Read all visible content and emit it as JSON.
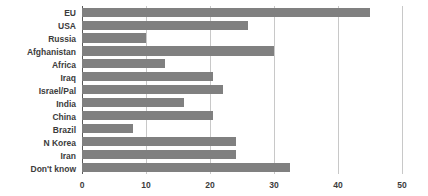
{
  "chart_data": {
    "type": "bar",
    "orientation": "horizontal",
    "title": "",
    "subtitle": "",
    "xlabel": "",
    "ylabel": "",
    "xlim": [
      0,
      50
    ],
    "ylim": null,
    "xticks": [
      0,
      10,
      20,
      30,
      40,
      50
    ],
    "xtick_labels": [
      "0",
      "10",
      "20",
      "30",
      "40",
      "50"
    ],
    "grid": "vertical",
    "legend": null,
    "legend_position": "none",
    "bar_color": "#808080",
    "gridline_color": "#c8c8c8",
    "axis_color": "#5a5a5a",
    "background_color": "#ffffff",
    "label_color": "#3c3c3c",
    "categories": [
      "EU",
      "USA",
      "Russia",
      "Afghanistan",
      "Africa",
      "Iraq",
      "Israel/Pal",
      "India",
      "China",
      "Brazil",
      "N Korea",
      "Iran",
      "Don't know"
    ],
    "values": [
      45,
      26,
      10,
      30,
      13,
      20.5,
      22,
      16,
      20.5,
      8,
      24,
      24,
      32.5
    ]
  }
}
